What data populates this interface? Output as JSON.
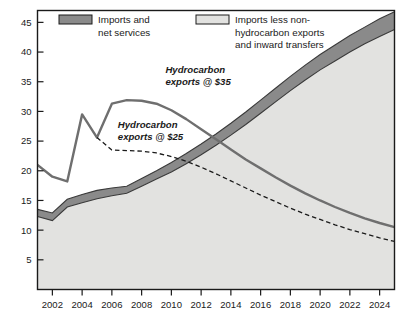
{
  "chart_data": {
    "type": "area",
    "title": "",
    "subtitle": "",
    "xlabel": "",
    "ylabel": "",
    "xlim": [
      2001,
      2025
    ],
    "ylim": [
      0,
      47
    ],
    "grid": false,
    "legend_position": "top",
    "x_ticks": [
      "2002",
      "2004",
      "2006",
      "2008",
      "2010",
      "2012",
      "2014",
      "2016",
      "2018",
      "2020",
      "2022",
      "2024"
    ],
    "x_tick_values": [
      2002,
      2004,
      2006,
      2008,
      2010,
      2012,
      2014,
      2016,
      2018,
      2020,
      2022,
      2024
    ],
    "y_ticks": [
      "5",
      "10",
      "15",
      "20",
      "25",
      "30",
      "35",
      "40",
      "45"
    ],
    "y_tick_values": [
      5,
      10,
      15,
      20,
      25,
      30,
      35,
      40,
      45
    ],
    "legend": [
      {
        "key": "imports-net-services",
        "label_line1": "Imports and",
        "label_line2": "net services",
        "label_line3": "",
        "color": "#8a8a8a",
        "swatch": "dark-gray-filled"
      },
      {
        "key": "imports-less-nonhydrocarbon",
        "label_line1": "Imports less non-",
        "label_line2": "hydrocarbon exports",
        "label_line3": "and inward transfers",
        "color": "#e2e2e0",
        "swatch": "light-gray-filled"
      }
    ],
    "annotations": [
      {
        "key": "hydrocarbon-35",
        "line1": "Hydrocarbon",
        "line2": "exports @ $35",
        "x": 2009.6,
        "y": 36.5
      },
      {
        "key": "hydrocarbon-25",
        "line1": "Hydrocarbon",
        "line2": "exports @ $25",
        "x": 2006.4,
        "y": 27.2
      }
    ],
    "x": [
      2001,
      2002,
      2003,
      2004,
      2005,
      2006,
      2007,
      2008,
      2009,
      2010,
      2011,
      2012,
      2013,
      2014,
      2015,
      2016,
      2017,
      2018,
      2019,
      2020,
      2021,
      2022,
      2023,
      2024,
      2025
    ],
    "series": [
      {
        "name": "Imports less non-hydrocarbon exports and inward transfers",
        "key": "imports-less-nonhydrocarbon",
        "type": "area-lower",
        "color": "#e2e2e0",
        "values": [
          12.3,
          11.6,
          13.9,
          14.6,
          15.3,
          15.8,
          16.2,
          17.4,
          18.6,
          19.8,
          21.2,
          22.7,
          24.3,
          26.0,
          27.8,
          29.7,
          31.6,
          33.5,
          35.3,
          37.0,
          38.5,
          40.0,
          41.4,
          42.6,
          43.8
        ]
      },
      {
        "name": "Imports and net services",
        "key": "imports-net-services",
        "type": "area-upper",
        "color": "#8a8a8a",
        "values": [
          13.5,
          12.9,
          15.2,
          16.0,
          16.7,
          17.1,
          17.4,
          18.7,
          20.0,
          21.4,
          22.9,
          24.5,
          26.2,
          28.0,
          29.9,
          31.9,
          33.9,
          35.9,
          37.8,
          39.6,
          41.2,
          42.8,
          44.2,
          45.6,
          46.8
        ]
      },
      {
        "name": "Hydrocarbon exports @ $35",
        "key": "hydrocarbon-exports-35",
        "type": "line-solid",
        "color": "#6f6f6f",
        "values": [
          21.0,
          19.0,
          18.2,
          29.5,
          25.6,
          31.3,
          31.9,
          31.8,
          31.3,
          30.2,
          28.7,
          27.0,
          25.3,
          23.6,
          21.9,
          20.4,
          18.9,
          17.5,
          16.2,
          15.0,
          13.9,
          12.9,
          12.0,
          11.2,
          10.5
        ]
      },
      {
        "name": "Hydrocarbon exports @ $25",
        "key": "hydrocarbon-exports-25",
        "type": "line-dashed",
        "color": "#1a1a1a",
        "values": [
          null,
          null,
          null,
          null,
          25.6,
          23.5,
          23.4,
          23.3,
          23.0,
          22.4,
          21.6,
          20.6,
          19.5,
          18.3,
          17.1,
          15.9,
          14.8,
          13.7,
          12.7,
          11.8,
          10.9,
          10.1,
          9.4,
          8.7,
          8.1
        ]
      }
    ]
  }
}
